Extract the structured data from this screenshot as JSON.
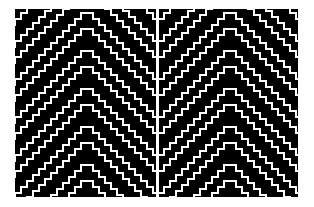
{
  "figure": {
    "title": "",
    "background_color": "#ffffff",
    "panel_background_color": "#000000",
    "line_color": "#ffffff",
    "divider_color": "#ffffff",
    "canvas_width": 314,
    "canvas_height": 207,
    "plot_left": 15,
    "plot_top": 9,
    "plot_width": 283,
    "plot_height": 188,
    "divider_width": 3
  },
  "chart_data": {
    "type": "heatmap",
    "xlabel": "",
    "ylabel": "",
    "grid": false,
    "legend_position": "none",
    "panels": [
      {
        "name": "left-panel",
        "width": 141,
        "height": 188,
        "background": "#000000",
        "line_color": "#ffffff",
        "pattern": "chevron-staircase",
        "apex_x_fraction": 0.5,
        "step_width": 6,
        "step_height": 6,
        "line_thickness": 2,
        "row_spacing": 19,
        "row_count": 11,
        "row_phase_offset": 3,
        "slope_sign_left": -1,
        "slope_sign_right": 1
      },
      {
        "name": "right-panel",
        "width": 139,
        "height": 188,
        "background": "#000000",
        "line_color": "#ffffff",
        "pattern": "chevron-staircase",
        "apex_x_fraction": 0.5,
        "step_width": 6,
        "step_height": 6,
        "line_thickness": 2,
        "row_spacing": 19,
        "row_count": 11,
        "row_phase_offset": 3,
        "slope_sign_left": -1,
        "slope_sign_right": 1
      }
    ]
  }
}
